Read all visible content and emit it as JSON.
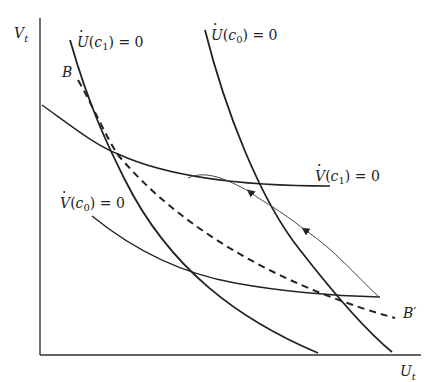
{
  "diagram": {
    "axes": {
      "y_label": "V",
      "y_label_sub": "t",
      "x_label": "U",
      "x_label_sub": "t"
    },
    "curves": {
      "u_dot_c1": {
        "label_fn": "U",
        "label_arg": "c",
        "label_sub": "1",
        "label_rest": "= 0"
      },
      "u_dot_c0": {
        "label_fn": "U",
        "label_arg": "c",
        "label_sub": "0",
        "label_rest": "= 0"
      },
      "v_dot_c1": {
        "label_fn": "V",
        "label_arg": "c",
        "label_sub": "1",
        "label_rest": "= 0"
      },
      "v_dot_c0": {
        "label_fn": "V",
        "label_arg": "c",
        "label_sub": "0",
        "label_rest": "= 0"
      }
    },
    "dashed_line": {
      "start_label": "B",
      "end_label": "B′"
    },
    "colors": {
      "line": "#222222",
      "background": "#ffffff"
    }
  }
}
